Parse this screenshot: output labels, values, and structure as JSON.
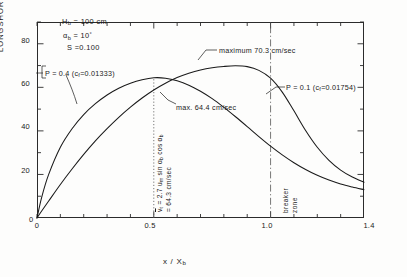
{
  "chart_data": {
    "type": "line",
    "title": "",
    "xlabel": "x / Xb",
    "ylabel": "LONGSHORE CURRENT VELOCITY, v (cm/sec)",
    "xlim": [
      0,
      1.4
    ],
    "ylim": [
      0,
      90
    ],
    "grid": false,
    "legend": "none",
    "x_ticks_major": [
      "0",
      "0.5",
      "1.0",
      "1.4"
    ],
    "x_tick_values": [
      0,
      0.5,
      1.0,
      1.4
    ],
    "x_minor_step": 0.1,
    "y_ticks_major": [
      "20",
      "40",
      "60",
      "80"
    ],
    "y_tick_values": [
      20,
      40,
      60,
      80
    ],
    "y_minor_values": [
      10,
      30,
      50,
      70,
      90
    ],
    "series": [
      {
        "name": "P = 0.4 (cf = 0.01333)",
        "P": 0.4,
        "cf": 0.01333,
        "maximum_value": 64.4,
        "maximum_label": "max. 64.4 cm/sec",
        "maximum_x": 0.5,
        "x": [
          0.0,
          0.02,
          0.05,
          0.1,
          0.15,
          0.2,
          0.25,
          0.3,
          0.35,
          0.4,
          0.45,
          0.5,
          0.55,
          0.6,
          0.65,
          0.7,
          0.75,
          0.8,
          0.85,
          0.9,
          0.95,
          1.0,
          1.05,
          1.1,
          1.15,
          1.2,
          1.25,
          1.3,
          1.35,
          1.4
        ],
        "y": [
          0.0,
          9.5,
          20.0,
          32.5,
          41.0,
          47.5,
          52.5,
          56.5,
          59.6,
          61.9,
          63.5,
          64.4,
          64.2,
          63.0,
          61.0,
          58.2,
          54.8,
          50.8,
          46.5,
          42.0,
          37.4,
          33.0,
          29.0,
          25.4,
          22.3,
          19.6,
          17.4,
          15.6,
          14.2,
          13.0
        ]
      },
      {
        "name": "P = 0.1 (cf = 0.01754)",
        "P": 0.1,
        "cf": 0.01754,
        "maximum_value": 70.3,
        "maximum_label": "maximum  70.3 cm/sec",
        "maximum_x": 0.63,
        "x": [
          0.0,
          0.02,
          0.05,
          0.1,
          0.15,
          0.2,
          0.25,
          0.3,
          0.35,
          0.4,
          0.45,
          0.5,
          0.55,
          0.6,
          0.65,
          0.7,
          0.75,
          0.8,
          0.85,
          0.9,
          0.95,
          1.0,
          1.05,
          1.1,
          1.15,
          1.2,
          1.25,
          1.3,
          1.35,
          1.4
        ],
        "y": [
          0.0,
          3.2,
          7.8,
          15.4,
          22.5,
          29.2,
          35.4,
          41.0,
          46.2,
          50.9,
          55.1,
          58.8,
          61.9,
          64.5,
          66.5,
          68.0,
          69.0,
          69.6,
          69.9,
          69.5,
          67.8,
          64.2,
          57.8,
          49.2,
          40.2,
          32.5,
          26.5,
          22.0,
          18.8,
          16.4
        ]
      }
    ],
    "reference_lines": [
      {
        "name": "mean-velocity-line",
        "x": 0.5,
        "style": "dotted",
        "y_from": 0,
        "y_to": 64.4
      },
      {
        "name": "breaker-zone-line",
        "x": 1.0,
        "style": "dash-dot",
        "y_from": 0,
        "y_to": 90
      }
    ]
  },
  "axes": {
    "y_label": "LONGSHORE CURRENT VELOCITY, v (cm/sec)",
    "x_label_num": "x / X",
    "x_label_sub": "b",
    "y_ticks": [
      "80",
      "60",
      "40",
      "20"
    ],
    "x_ticks": [
      "0.5",
      "1.0",
      "1.4"
    ],
    "origin_label": "0"
  },
  "params": {
    "line1_sym": "H",
    "line1_sub": "b",
    "line1_val": "= 100 cm",
    "line2_sym": "α",
    "line2_sub": "b",
    "line2_val": "= 10",
    "line2_sup": "°",
    "line3_sym": "S",
    "line3_val": "=0.100"
  },
  "annotations": {
    "curve_p04_pre": "P = 0.4 (c",
    "curve_p04_sub": "f",
    "curve_p04_post": "=0.01333)",
    "curve_p01_pre": "P = 0.1 (c",
    "curve_p01_sub": "f",
    "curve_p01_post": "=0.01754)",
    "maximum": "maximum   70.3 cm/sec",
    "max_644": "max. 64.4 cm/sec",
    "mean_eq_part1_a": "v",
    "mean_eq_part1_b": " = 2.7 u",
    "mean_eq_part1_sub": "m",
    "mean_eq_part1_c": " sin α",
    "mean_eq_part1_sub2": "b",
    "mean_eq_part1_d": " cos α",
    "mean_eq_part1_sub3": "b",
    "mean_eq_part2": "= 64.3 cm/sec",
    "breaker_word1": "breaker",
    "breaker_word2": "zone"
  },
  "colors": {
    "axis": "#2b2b2b",
    "curve": "#1a1a1a",
    "background": "#fdfdfc",
    "reference": "#555555"
  }
}
